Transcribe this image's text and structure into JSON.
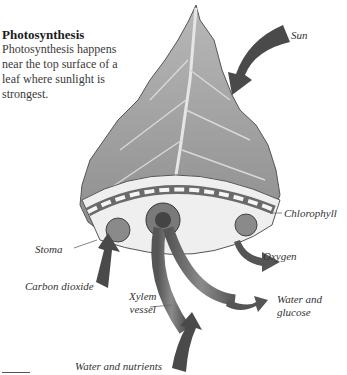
{
  "title": "Photosynthesis",
  "description": "Photosynthesis happens near the top surface of a leaf where sunlight is strongest.",
  "labels": {
    "sun": "Sun",
    "chlorophyll": "Chlorophyll",
    "stoma": "Stoma",
    "oxygen": "Oxygen",
    "carbon_dioxide": "Carbon dioxide",
    "xylem_line1": "Xylem",
    "xylem_line2": "vessel",
    "water_glucose_line1": "Water and",
    "water_glucose_line2": "glucose",
    "water_nutrients": "Water and nutrients"
  },
  "colors": {
    "leaf": "#9a9a9a",
    "arrow": "#4a4a4a",
    "tube": "#6a6a6a",
    "text": "#333333"
  }
}
